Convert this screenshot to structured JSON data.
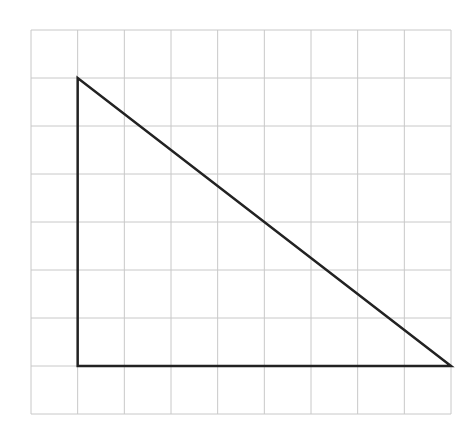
{
  "diagram": {
    "type": "grid-triangle",
    "grid": {
      "columns": 9,
      "rows": 8,
      "left": 31,
      "top": 30,
      "right": 451,
      "bottom": 414,
      "line_color": "#c8c8c8"
    },
    "triangle": {
      "vertices_grid": [
        [
          1,
          1
        ],
        [
          1,
          7
        ],
        [
          9,
          7
        ]
      ],
      "stroke_color": "#222222",
      "stroke_width": 2.5,
      "description": "Right triangle with vertical leg of 6 units and horizontal leg of 8 units"
    }
  }
}
